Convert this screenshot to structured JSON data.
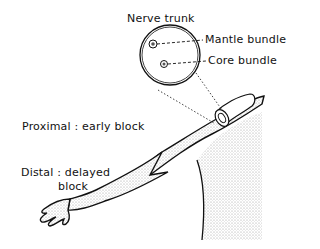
{
  "figure": {
    "type": "anatomical-diagram",
    "labels": {
      "nerve_trunk": "Nerve trunk",
      "mantle_bundle": "Mantle bundle",
      "core_bundle": "Core bundle",
      "proximal": "Proximal : early block",
      "distal_line1": "Distal :  delayed",
      "distal_line2": "block"
    },
    "colors": {
      "ink": "#111111",
      "stipple": "#bdbdbd",
      "background": "#ffffff"
    }
  }
}
